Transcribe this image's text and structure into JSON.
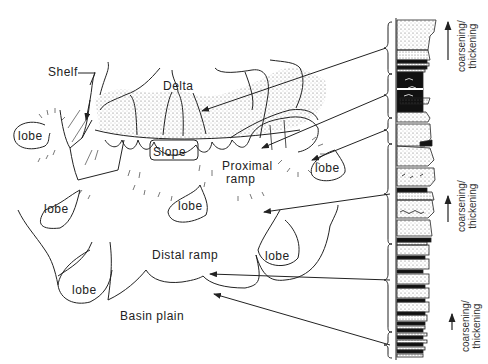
{
  "diagram": {
    "type": "depositional model with stratigraphic column",
    "labels": {
      "shelf": "Shelf",
      "delta": "Delta",
      "slope": "Slope",
      "proximal_ramp_1": "Proximal",
      "proximal_ramp_2": "ramp",
      "distal_ramp": "Distal ramp",
      "basin_plain": "Basin plain",
      "lobe": "lobe"
    },
    "lobes": [
      {
        "id": "lobe-1",
        "label": "lobe"
      },
      {
        "id": "lobe-2",
        "label": "lobe"
      },
      {
        "id": "lobe-3",
        "label": "lobe"
      },
      {
        "id": "lobe-4",
        "label": "lobe"
      },
      {
        "id": "lobe-5",
        "label": "lobe"
      },
      {
        "id": "lobe-6",
        "label": "lobe"
      }
    ],
    "column_annotations": [
      {
        "line1": "coarsening/",
        "line2": "thickening"
      },
      {
        "line1": "coarsening/",
        "line2": "thickening"
      },
      {
        "line1": "coarsening/",
        "line2": "thickening"
      }
    ],
    "colors": {
      "ink": "#222222",
      "background": "#ffffff",
      "stipple": "#777777"
    }
  }
}
